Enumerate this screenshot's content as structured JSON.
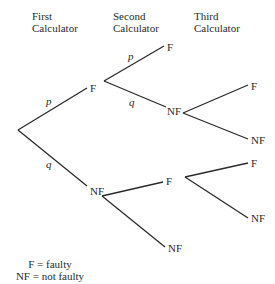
{
  "diagram": {
    "type": "probability-tree",
    "headers": [
      {
        "line1": "First",
        "line2": "Calculator"
      },
      {
        "line1": "Second",
        "line2": "Calculator"
      },
      {
        "line1": "Third",
        "line2": "Calculator"
      }
    ],
    "nodes": {
      "l1_top": "F",
      "l1_bottom": "NF",
      "l2_F_top": "F",
      "l2_F_bottom": "NF",
      "l2_NF_top": "F",
      "l2_NF_bottom": "NF",
      "l3_FNF_top": "F",
      "l3_FNF_bottom": "NF",
      "l3_NFF_top": "F",
      "l3_NFF_bottom": "NF"
    },
    "edge_labels": {
      "root_top": "p",
      "root_bottom": "q",
      "F_top": "p",
      "F_bottom": "q"
    },
    "legend": {
      "line1": "F = faulty",
      "line2": "NF = not faulty"
    }
  }
}
